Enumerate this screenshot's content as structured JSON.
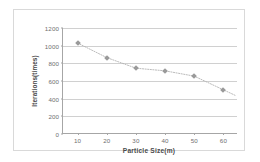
{
  "chart_data": {
    "type": "line",
    "title": "",
    "xlabel": "Particle Size(m)",
    "ylabel": "Iterations(times)",
    "x": [
      10,
      20,
      30,
      40,
      50,
      60
    ],
    "values": [
      1030,
      865,
      745,
      715,
      655,
      500
    ],
    "series": [
      {
        "name": "Iterations",
        "values": [
          1030,
          865,
          745,
          715,
          655,
          500
        ]
      }
    ],
    "xlim": [
      5,
      65
    ],
    "ylim": [
      0,
      1200
    ],
    "xticks": [
      "10",
      "20",
      "30",
      "40",
      "50",
      "60"
    ],
    "yticks": [
      "0",
      "200",
      "400",
      "600",
      "800",
      "1000",
      "1200"
    ],
    "grid": "horizontal",
    "legend": "none",
    "line_style": "dotted",
    "marker_style": "diamond",
    "colors": {
      "line": "#b3b3b3",
      "marker": "#9a9a9a",
      "grid": "#d0d0d0",
      "axis": "#a6a6a6",
      "text": "#6f6f6f",
      "title_text": "#4a4a4a",
      "frame": "#d9d9d9",
      "background": "#ffffff"
    }
  }
}
